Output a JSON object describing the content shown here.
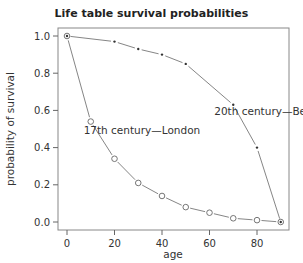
{
  "chart_data": {
    "type": "line",
    "title": "Life table survival probabilities",
    "xlabel": "age",
    "ylabel": "probability of survival",
    "xlim": [
      -4,
      94
    ],
    "ylim": [
      -0.04,
      1.04
    ],
    "xticks": [
      0,
      20,
      40,
      60,
      80
    ],
    "yticks": [
      0.0,
      0.2,
      0.4,
      0.6,
      0.8,
      1.0
    ],
    "xtick_labels": [
      "0",
      "20",
      "40",
      "60",
      "80"
    ],
    "ytick_labels": [
      "0.0",
      "0.2",
      "0.4",
      "0.6",
      "0.8",
      "1.0"
    ],
    "grid": false,
    "legend": "none (inline annotations)",
    "series": [
      {
        "name": "17th century—London",
        "marker": "open-circle",
        "x": [
          0,
          10,
          20,
          30,
          40,
          50,
          60,
          70,
          80,
          90
        ],
        "values": [
          1.0,
          0.54,
          0.34,
          0.21,
          0.14,
          0.08,
          0.05,
          0.02,
          0.01,
          0.0
        ]
      },
      {
        "name": "20th century—Berkeley",
        "marker": "small-dot",
        "x": [
          0,
          20,
          30,
          40,
          50,
          70,
          80,
          90
        ],
        "values": [
          1.0,
          0.97,
          0.93,
          0.9,
          0.85,
          0.63,
          0.4,
          0.0
        ]
      }
    ],
    "annotations": [
      {
        "text": "20th century—Berkeley",
        "x": 62,
        "y": 0.575
      },
      {
        "text": "17th century—London",
        "x": 7,
        "y": 0.475
      }
    ]
  }
}
